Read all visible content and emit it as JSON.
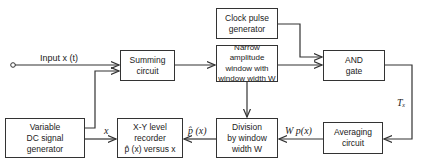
{
  "blocks": {
    "clock": [
      "Clock pulse",
      "generator"
    ],
    "narrow_window": [
      "Narrow amplitude",
      "window with",
      "window width W"
    ],
    "summing": [
      "Summing",
      "circuit"
    ],
    "and_gate": [
      "AND",
      "gate"
    ],
    "dc_generator": [
      "Variable",
      "DC signal",
      "generator"
    ],
    "xy_recorder": [
      "X-Y level",
      "recorder",
      "p̂ (x) versus x"
    ],
    "division": [
      "Division",
      "by window",
      "width W"
    ],
    "averaging": [
      "Averaging",
      "circuit"
    ]
  },
  "signals": {
    "input": "Input x (t)",
    "x": "x",
    "p_hat": "p̂ (x)",
    "wpx": "W p(x)",
    "tx": "Tₓ"
  }
}
